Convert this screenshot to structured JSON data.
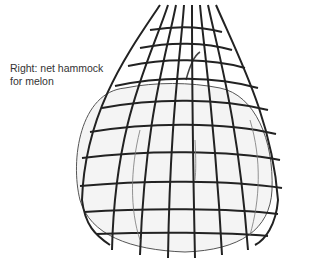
{
  "caption": {
    "line1": "Right: net hammock",
    "line2": "for melon"
  },
  "illustration": {
    "subject": "melon-in-net-hammock",
    "line_color": "#222222",
    "fill_color": "#f4f4f4"
  }
}
